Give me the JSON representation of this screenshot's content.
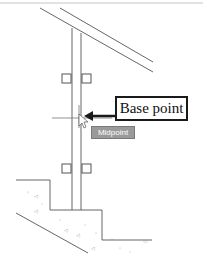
{
  "drawing": {
    "colors": {
      "line": "#555555",
      "faint_line": "#bbbbbb",
      "callout_border": "#1a1a1a",
      "arrow": "#1a1a1a",
      "tooltip_bg": "#9a9a9a",
      "tooltip_text": "#ffffff",
      "hatch": "#aaaaaa"
    },
    "grips": [
      {
        "name": "grip-upper-left"
      },
      {
        "name": "grip-upper-right"
      },
      {
        "name": "grip-lower-left"
      },
      {
        "name": "grip-lower-right"
      }
    ]
  },
  "callout": {
    "label": "Base point"
  },
  "snap_tooltip": {
    "label": "Midpoint"
  },
  "cursor": {
    "icon": "crosshair-cursor-icon"
  }
}
